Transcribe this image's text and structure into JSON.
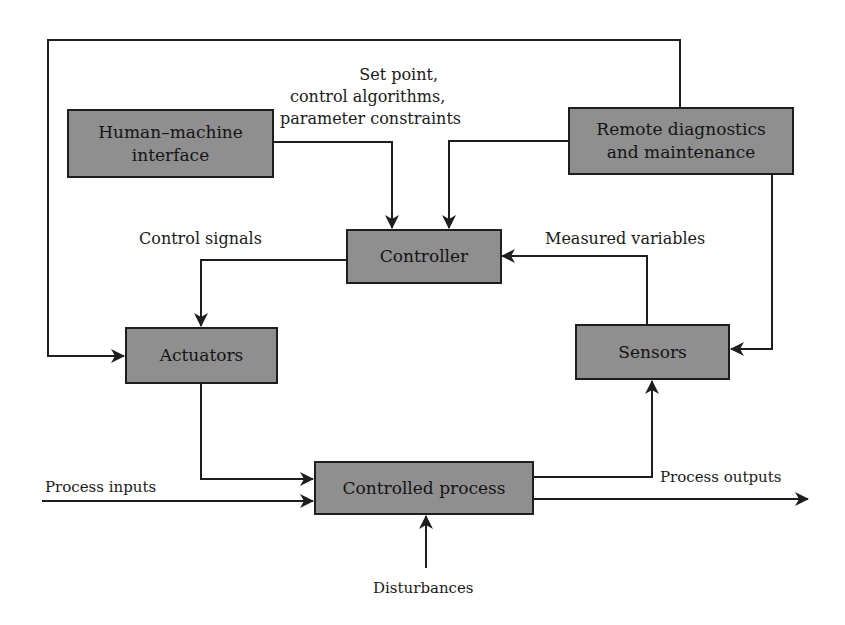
{
  "diagram": {
    "type": "control-system-block-diagram",
    "colors": {
      "box_fill": "#8f8f8f",
      "line": "#1e1e1e",
      "background": "#ffffff"
    },
    "blocks": {
      "hmi": {
        "label": "Human–machine interface",
        "line1": "Human–machine",
        "line2": "interface"
      },
      "remote": {
        "label": "Remote diagnostics and maintenance",
        "line1": "Remote diagnostics",
        "line2": "and maintenance"
      },
      "controller": {
        "label": "Controller"
      },
      "actuators": {
        "label": "Actuators"
      },
      "sensors": {
        "label": "Sensors"
      },
      "process": {
        "label": "Controlled process"
      }
    },
    "labels": {
      "setpoint": {
        "line1": "Set point,",
        "line2": "control algorithms,",
        "line3": "parameter constraints"
      },
      "control_signals": "Control signals",
      "measured_variables": "Measured variables",
      "process_inputs": "Process inputs",
      "process_outputs": "Process outputs",
      "disturbances": "Disturbances"
    },
    "connections": [
      {
        "from": "hmi",
        "to": "controller",
        "label": "Set point, control algorithms, parameter constraints"
      },
      {
        "from": "remote",
        "to": "controller"
      },
      {
        "from": "remote",
        "to": "actuators",
        "via": "top feedback loop"
      },
      {
        "from": "remote",
        "to": "sensors"
      },
      {
        "from": "controller",
        "to": "actuators",
        "label": "Control signals"
      },
      {
        "from": "sensors",
        "to": "controller",
        "label": "Measured variables"
      },
      {
        "from": "actuators",
        "to": "process"
      },
      {
        "from": "process",
        "to": "sensors"
      },
      {
        "from": "inputs",
        "to": "process",
        "label": "Process inputs"
      },
      {
        "from": "process",
        "to": "outputs",
        "label": "Process outputs"
      },
      {
        "from": "disturbances",
        "to": "process",
        "label": "Disturbances"
      }
    ]
  }
}
